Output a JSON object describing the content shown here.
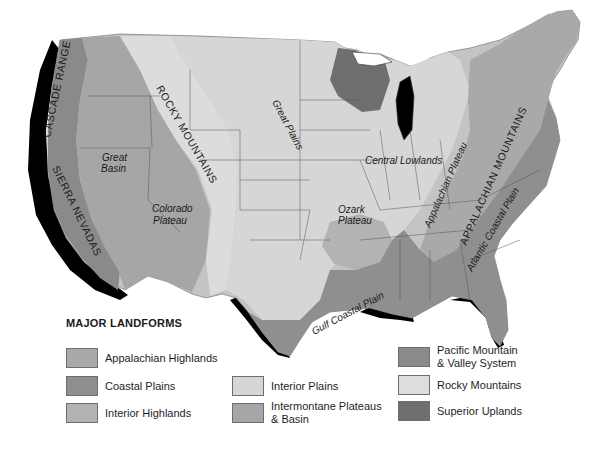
{
  "map": {
    "colors": {
      "appalachian_highlands": "#a9a9a9",
      "coastal_plains": "#8f8f8f",
      "interior_highlands": "#b3b3b3",
      "interior_plains": "#d6d6d6",
      "intermontane": "#a6a6a6",
      "pacific": "#8a8a8a",
      "rocky": "#dddddd",
      "superior": "#6f6f6f",
      "shadow": "#000000",
      "border": "#555555"
    },
    "region_labels": {
      "cascade_range": "CASCADE RANGE",
      "sierra_nevadas": "SIERRA NEVADAS",
      "rocky_mountains": "ROCKY MOUNTAINS",
      "great_basin_line1": "Great",
      "great_basin_line2": "Basin",
      "colorado_plateau_line1": "Colorado",
      "colorado_plateau_line2": "Plateau",
      "great_plains": "Great Plains",
      "central_lowlands": "Central Lowlands",
      "ozark_plateau_line1": "Ozark",
      "ozark_plateau_line2": "Plateau",
      "appalachian_plateau": "Appalachian Plateau",
      "appalachian_mountains": "APPALACHIAN MOUNTAINS",
      "atlantic_coastal_plain": "Atlantic Coastal Plain",
      "gulf_coastal_plain": "Gulf Coastal Plain"
    }
  },
  "legend": {
    "title": "MAJOR LANDFORMS",
    "items": [
      {
        "label": "Appalachian Highlands",
        "color": "#a9a9a9"
      },
      {
        "label": "Coastal Plains",
        "color": "#8f8f8f"
      },
      {
        "label": "Interior Highlands",
        "color": "#b3b3b3"
      },
      {
        "label": "Interior Plains",
        "color": "#d6d6d6"
      },
      {
        "label": "Intermontane Plateaus\n& Basin",
        "color": "#a6a6a6"
      },
      {
        "label": "Pacific Mountain\n& Valley System",
        "color": "#8a8a8a"
      },
      {
        "label": "Rocky Mountains",
        "color": "#dddddd"
      },
      {
        "label": "Superior Uplands",
        "color": "#6f6f6f"
      }
    ]
  }
}
